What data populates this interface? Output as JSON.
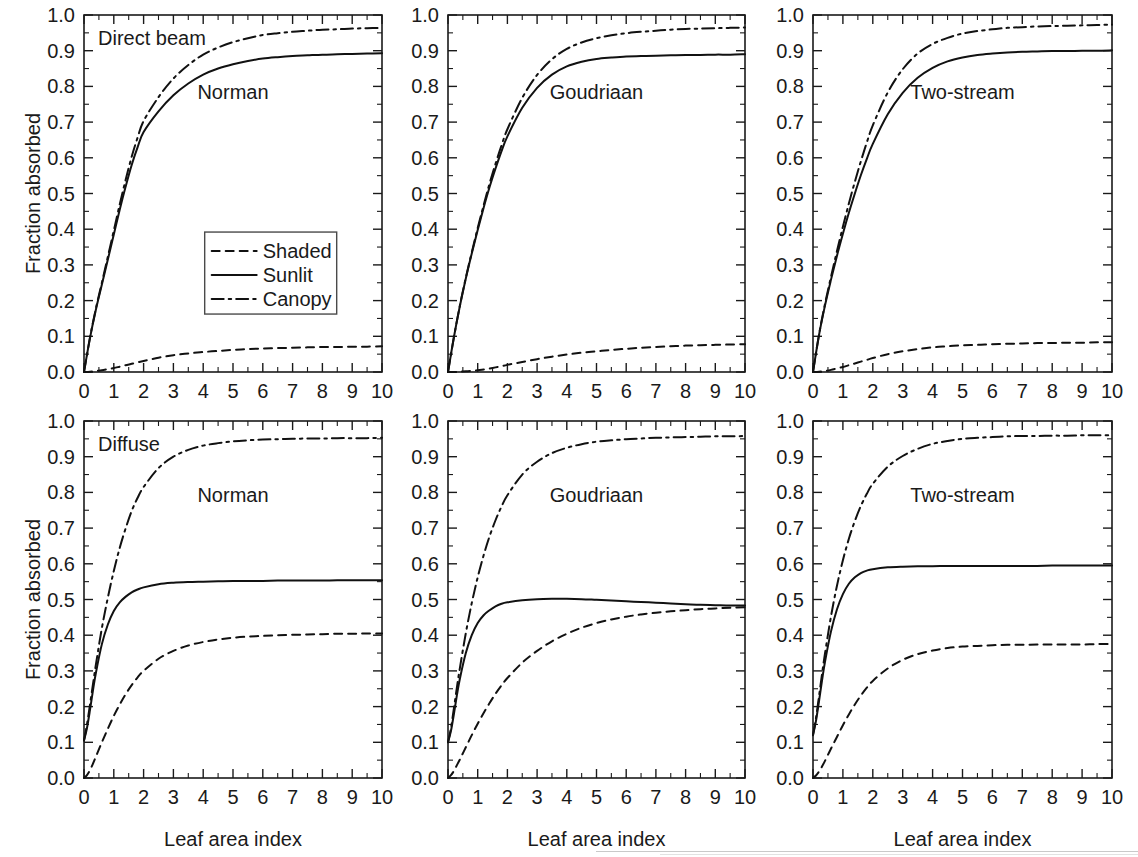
{
  "figure": {
    "y_axis_label": "Fraction absorbed",
    "x_axis_label": "Leaf area index",
    "y_ticks": [
      "0.0",
      "0.1",
      "0.2",
      "0.3",
      "0.4",
      "0.5",
      "0.6",
      "0.7",
      "0.8",
      "0.9",
      "1.0"
    ],
    "x_ticks": [
      "0",
      "1",
      "2",
      "3",
      "4",
      "5",
      "6",
      "7",
      "8",
      "9",
      "10"
    ],
    "legend": {
      "items": [
        {
          "label": "Shaded",
          "style": "dashed"
        },
        {
          "label": "Sunlit",
          "style": "solid"
        },
        {
          "label": "Canopy",
          "style": "dash-dot"
        }
      ]
    }
  },
  "chart_data": [
    {
      "type": "line",
      "panel": "top-left",
      "title": "",
      "condition_label": "Direct beam",
      "model_label": "Norman",
      "xlabel": "Leaf area index",
      "ylabel": "Fraction absorbed",
      "xlim": [
        0,
        10
      ],
      "ylim": [
        0,
        1
      ],
      "grid": false,
      "legend_position": "inside-center",
      "x": [
        0.0,
        0.2,
        0.4,
        0.6,
        0.8,
        1.0,
        1.2,
        1.4,
        1.6,
        1.8,
        2.0,
        2.5,
        3.0,
        3.5,
        4.0,
        4.5,
        5.0,
        5.5,
        6.0,
        6.5,
        7.0,
        7.5,
        8.0,
        8.5,
        9.0,
        9.5,
        10.0
      ],
      "series": [
        {
          "name": "Sunlit",
          "style": "solid",
          "values": [
            0.0,
            0.095,
            0.175,
            0.245,
            0.315,
            0.385,
            0.455,
            0.52,
            0.58,
            0.63,
            0.672,
            0.73,
            0.775,
            0.808,
            0.833,
            0.85,
            0.862,
            0.871,
            0.878,
            0.882,
            0.885,
            0.887,
            0.889,
            0.89,
            0.891,
            0.892,
            0.893
          ]
        },
        {
          "name": "Shaded",
          "style": "dashed",
          "values": [
            0.0,
            0.001,
            0.003,
            0.005,
            0.008,
            0.011,
            0.015,
            0.019,
            0.023,
            0.027,
            0.031,
            0.04,
            0.047,
            0.052,
            0.056,
            0.059,
            0.062,
            0.064,
            0.066,
            0.067,
            0.068,
            0.069,
            0.07,
            0.07,
            0.071,
            0.071,
            0.072
          ]
        },
        {
          "name": "Canopy",
          "style": "dash-dot",
          "values": [
            0.0,
            0.096,
            0.178,
            0.25,
            0.323,
            0.396,
            0.47,
            0.539,
            0.603,
            0.657,
            0.703,
            0.77,
            0.822,
            0.86,
            0.889,
            0.909,
            0.924,
            0.935,
            0.944,
            0.949,
            0.953,
            0.956,
            0.959,
            0.96,
            0.962,
            0.963,
            0.964
          ]
        }
      ]
    },
    {
      "type": "line",
      "panel": "top-center",
      "title": "",
      "condition_label": "",
      "model_label": "Goudriaan",
      "xlabel": "Leaf area index",
      "ylabel": "",
      "xlim": [
        0,
        10
      ],
      "ylim": [
        0,
        1
      ],
      "grid": false,
      "x": [
        0.0,
        0.2,
        0.4,
        0.6,
        0.8,
        1.0,
        1.2,
        1.4,
        1.6,
        1.8,
        2.0,
        2.5,
        3.0,
        3.5,
        4.0,
        4.5,
        5.0,
        5.5,
        6.0,
        6.5,
        7.0,
        7.5,
        8.0,
        8.5,
        9.0,
        9.5,
        10.0
      ],
      "series": [
        {
          "name": "Sunlit",
          "style": "solid",
          "values": [
            0.0,
            0.098,
            0.185,
            0.262,
            0.332,
            0.398,
            0.46,
            0.518,
            0.57,
            0.618,
            0.66,
            0.74,
            0.796,
            0.833,
            0.856,
            0.869,
            0.877,
            0.881,
            0.884,
            0.885,
            0.886,
            0.887,
            0.888,
            0.888,
            0.889,
            0.889,
            0.89
          ]
        },
        {
          "name": "Shaded",
          "style": "dashed",
          "values": [
            0.0,
            0.0,
            0.001,
            0.002,
            0.003,
            0.005,
            0.007,
            0.01,
            0.013,
            0.016,
            0.02,
            0.028,
            0.036,
            0.043,
            0.049,
            0.054,
            0.058,
            0.062,
            0.065,
            0.068,
            0.07,
            0.072,
            0.074,
            0.075,
            0.076,
            0.077,
            0.078
          ]
        },
        {
          "name": "Canopy",
          "style": "dash-dot",
          "values": [
            0.0,
            0.098,
            0.186,
            0.264,
            0.335,
            0.403,
            0.467,
            0.528,
            0.583,
            0.634,
            0.68,
            0.768,
            0.832,
            0.876,
            0.905,
            0.923,
            0.935,
            0.943,
            0.949,
            0.953,
            0.956,
            0.959,
            0.961,
            0.962,
            0.963,
            0.964,
            0.965
          ]
        }
      ]
    },
    {
      "type": "line",
      "panel": "top-right",
      "title": "",
      "condition_label": "",
      "model_label": "Two-stream",
      "xlabel": "Leaf area index",
      "ylabel": "",
      "xlim": [
        0,
        10
      ],
      "ylim": [
        0,
        1
      ],
      "grid": false,
      "x": [
        0.0,
        0.2,
        0.4,
        0.6,
        0.8,
        1.0,
        1.2,
        1.4,
        1.6,
        1.8,
        2.0,
        2.5,
        3.0,
        3.5,
        4.0,
        4.5,
        5.0,
        5.5,
        6.0,
        6.5,
        7.0,
        7.5,
        8.0,
        8.5,
        9.0,
        9.5,
        10.0
      ],
      "series": [
        {
          "name": "Sunlit",
          "style": "solid",
          "values": [
            0.0,
            0.103,
            0.186,
            0.258,
            0.325,
            0.387,
            0.446,
            0.5,
            0.551,
            0.597,
            0.639,
            0.722,
            0.782,
            0.824,
            0.852,
            0.87,
            0.881,
            0.888,
            0.892,
            0.895,
            0.897,
            0.898,
            0.899,
            0.899,
            0.9,
            0.9,
            0.901
          ]
        },
        {
          "name": "Shaded",
          "style": "dashed",
          "values": [
            0.0,
            0.001,
            0.003,
            0.006,
            0.01,
            0.014,
            0.019,
            0.024,
            0.029,
            0.034,
            0.039,
            0.05,
            0.058,
            0.064,
            0.069,
            0.072,
            0.075,
            0.076,
            0.078,
            0.079,
            0.08,
            0.081,
            0.081,
            0.082,
            0.082,
            0.083,
            0.083
          ]
        },
        {
          "name": "Canopy",
          "style": "dash-dot",
          "values": [
            0.0,
            0.104,
            0.19,
            0.266,
            0.338,
            0.407,
            0.472,
            0.533,
            0.59,
            0.643,
            0.691,
            0.783,
            0.848,
            0.892,
            0.919,
            0.936,
            0.948,
            0.955,
            0.96,
            0.964,
            0.966,
            0.968,
            0.969,
            0.97,
            0.971,
            0.972,
            0.973
          ]
        }
      ]
    },
    {
      "type": "line",
      "panel": "bottom-left",
      "title": "",
      "condition_label": "Diffuse",
      "model_label": "Norman",
      "xlabel": "Leaf area index",
      "ylabel": "Fraction absorbed",
      "xlim": [
        0,
        10
      ],
      "ylim": [
        0,
        1
      ],
      "grid": false,
      "x": [
        0.0,
        0.1,
        0.2,
        0.3,
        0.4,
        0.6,
        0.8,
        1.0,
        1.2,
        1.4,
        1.6,
        1.8,
        2.0,
        2.5,
        3.0,
        3.5,
        4.0,
        4.5,
        5.0,
        5.5,
        6.0,
        6.5,
        7.0,
        7.5,
        8.0,
        8.5,
        9.0,
        9.5,
        10.0
      ],
      "series": [
        {
          "name": "Sunlit",
          "style": "solid",
          "values": [
            0.105,
            0.14,
            0.19,
            0.245,
            0.295,
            0.375,
            0.43,
            0.468,
            0.492,
            0.508,
            0.52,
            0.528,
            0.534,
            0.543,
            0.547,
            0.549,
            0.55,
            0.551,
            0.552,
            0.552,
            0.552,
            0.553,
            0.553,
            0.553,
            0.553,
            0.554,
            0.554,
            0.554,
            0.554
          ]
        },
        {
          "name": "Shaded",
          "style": "dashed",
          "values": [
            0.0,
            0.008,
            0.022,
            0.04,
            0.06,
            0.1,
            0.138,
            0.174,
            0.206,
            0.235,
            0.26,
            0.282,
            0.3,
            0.334,
            0.356,
            0.371,
            0.381,
            0.388,
            0.393,
            0.396,
            0.398,
            0.4,
            0.401,
            0.402,
            0.403,
            0.404,
            0.404,
            0.405,
            0.405
          ]
        },
        {
          "name": "Canopy",
          "style": "dash-dot",
          "values": [
            0.105,
            0.15,
            0.205,
            0.262,
            0.318,
            0.42,
            0.505,
            0.58,
            0.645,
            0.7,
            0.748,
            0.785,
            0.815,
            0.868,
            0.9,
            0.919,
            0.931,
            0.938,
            0.943,
            0.946,
            0.948,
            0.949,
            0.95,
            0.951,
            0.951,
            0.952,
            0.952,
            0.952,
            0.953
          ]
        }
      ]
    },
    {
      "type": "line",
      "panel": "bottom-center",
      "title": "",
      "condition_label": "",
      "model_label": "Goudriaan",
      "xlabel": "Leaf area index",
      "ylabel": "",
      "xlim": [
        0,
        10
      ],
      "ylim": [
        0,
        1
      ],
      "grid": false,
      "x": [
        0.0,
        0.1,
        0.2,
        0.3,
        0.4,
        0.6,
        0.8,
        1.0,
        1.2,
        1.4,
        1.6,
        1.8,
        2.0,
        2.5,
        3.0,
        3.5,
        4.0,
        4.5,
        5.0,
        5.5,
        6.0,
        6.5,
        7.0,
        7.5,
        8.0,
        8.5,
        9.0,
        9.5,
        10.0
      ],
      "series": [
        {
          "name": "Sunlit",
          "style": "solid",
          "values": [
            0.1,
            0.132,
            0.18,
            0.232,
            0.278,
            0.35,
            0.4,
            0.434,
            0.456,
            0.47,
            0.481,
            0.488,
            0.492,
            0.498,
            0.501,
            0.502,
            0.502,
            0.501,
            0.499,
            0.497,
            0.495,
            0.493,
            0.491,
            0.489,
            0.487,
            0.485,
            0.484,
            0.483,
            0.483
          ]
        },
        {
          "name": "Shaded",
          "style": "dashed",
          "values": [
            0.0,
            0.008,
            0.02,
            0.036,
            0.052,
            0.086,
            0.12,
            0.152,
            0.182,
            0.21,
            0.236,
            0.259,
            0.28,
            0.323,
            0.356,
            0.383,
            0.404,
            0.421,
            0.434,
            0.444,
            0.452,
            0.458,
            0.463,
            0.467,
            0.47,
            0.473,
            0.475,
            0.477,
            0.478
          ]
        },
        {
          "name": "Canopy",
          "style": "dash-dot",
          "values": [
            0.1,
            0.14,
            0.196,
            0.254,
            0.308,
            0.406,
            0.49,
            0.562,
            0.624,
            0.677,
            0.722,
            0.76,
            0.792,
            0.85,
            0.886,
            0.91,
            0.925,
            0.935,
            0.942,
            0.946,
            0.949,
            0.951,
            0.953,
            0.954,
            0.955,
            0.956,
            0.957,
            0.957,
            0.958
          ]
        }
      ]
    },
    {
      "type": "line",
      "panel": "bottom-right",
      "title": "",
      "condition_label": "",
      "model_label": "Two-stream",
      "xlabel": "Leaf area index",
      "ylabel": "",
      "xlim": [
        0,
        10
      ],
      "ylim": [
        0,
        1
      ],
      "grid": false,
      "x": [
        0.0,
        0.1,
        0.2,
        0.3,
        0.4,
        0.6,
        0.8,
        1.0,
        1.2,
        1.4,
        1.6,
        1.8,
        2.0,
        2.5,
        3.0,
        3.5,
        4.0,
        4.5,
        5.0,
        5.5,
        6.0,
        6.5,
        7.0,
        7.5,
        8.0,
        8.5,
        9.0,
        9.5,
        10.0
      ],
      "series": [
        {
          "name": "Sunlit",
          "style": "solid",
          "values": [
            0.12,
            0.16,
            0.215,
            0.272,
            0.325,
            0.41,
            0.472,
            0.515,
            0.544,
            0.562,
            0.574,
            0.581,
            0.585,
            0.59,
            0.592,
            0.593,
            0.593,
            0.594,
            0.594,
            0.594,
            0.594,
            0.594,
            0.594,
            0.594,
            0.595,
            0.595,
            0.595,
            0.595,
            0.595
          ]
        },
        {
          "name": "Shaded",
          "style": "dashed",
          "values": [
            0.0,
            0.007,
            0.018,
            0.032,
            0.048,
            0.082,
            0.115,
            0.148,
            0.178,
            0.206,
            0.231,
            0.253,
            0.272,
            0.307,
            0.331,
            0.347,
            0.357,
            0.364,
            0.368,
            0.37,
            0.372,
            0.373,
            0.373,
            0.374,
            0.374,
            0.374,
            0.374,
            0.375,
            0.375
          ]
        },
        {
          "name": "Canopy",
          "style": "dash-dot",
          "values": [
            0.12,
            0.168,
            0.228,
            0.29,
            0.348,
            0.452,
            0.538,
            0.61,
            0.67,
            0.72,
            0.762,
            0.796,
            0.824,
            0.872,
            0.902,
            0.922,
            0.936,
            0.944,
            0.95,
            0.953,
            0.955,
            0.957,
            0.958,
            0.958,
            0.959,
            0.959,
            0.96,
            0.96,
            0.96
          ]
        }
      ]
    }
  ]
}
